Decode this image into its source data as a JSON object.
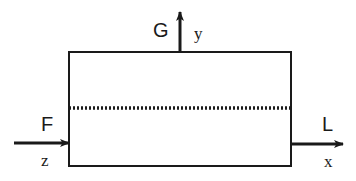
{
  "diagram": {
    "box": {
      "x": 69,
      "y": 52,
      "width": 222,
      "height": 114
    },
    "centerline": {
      "style": "dotted",
      "y": 108
    },
    "arrows": [
      {
        "id": "up",
        "label": "G",
        "axis": "y"
      },
      {
        "id": "left",
        "label": "F",
        "axis": "z"
      },
      {
        "id": "right",
        "label": "L",
        "axis": "x"
      }
    ],
    "colors": {
      "stroke": "#1a1a1a",
      "background": "#ffffff"
    }
  }
}
